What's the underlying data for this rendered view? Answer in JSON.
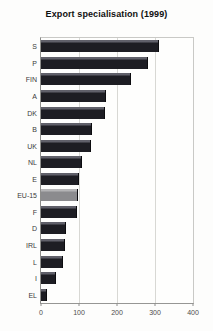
{
  "title": "Export specialisation (1999)",
  "chart_data": {
    "type": "bar",
    "orientation": "horizontal",
    "title": "Export specialisation (1999)",
    "xlabel": "",
    "ylabel": "",
    "categories": [
      "S",
      "P",
      "FIN",
      "A",
      "DK",
      "B",
      "UK",
      "NL",
      "E",
      "EU-15",
      "F",
      "D",
      "IRL",
      "L",
      "I",
      "EL"
    ],
    "values": [
      308,
      280,
      235,
      168,
      165,
      131,
      130,
      106,
      98,
      95,
      91,
      64,
      61,
      55,
      38,
      13
    ],
    "xlim": [
      0,
      400
    ],
    "x_ticks": [
      0,
      100,
      200,
      300,
      400
    ],
    "grid": true,
    "legend": "none",
    "highlight_category": "EU-15",
    "colors": {
      "bar_body": "#1d1d23",
      "bar_bevel": "#60606a",
      "highlight_bar_body": "#8b8b8e",
      "highlight_bar_bevel": "#b4b4b6",
      "gridline": "#d8d8d4",
      "axis": "#8d8d8b",
      "title_text": "#101010",
      "tick_text": "#4d4d4b",
      "background": "#fdfdfc"
    }
  }
}
